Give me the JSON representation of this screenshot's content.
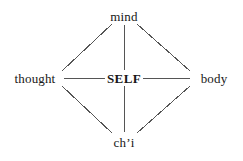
{
  "diagram": {
    "background_color": "#ffffff",
    "line_color": "#555555",
    "text_color": "#171717",
    "nodes": [
      {
        "id": "mind",
        "label": "mind",
        "x": 124,
        "y": 16,
        "emphasis": false
      },
      {
        "id": "thought",
        "label": "thought",
        "x": 35,
        "y": 78,
        "emphasis": false
      },
      {
        "id": "self",
        "label": "SELF",
        "x": 124,
        "y": 78,
        "emphasis": true
      },
      {
        "id": "body",
        "label": "body",
        "x": 214,
        "y": 78,
        "emphasis": false
      },
      {
        "id": "chi",
        "label": "ch’i",
        "x": 124,
        "y": 142,
        "emphasis": false
      }
    ],
    "edges": [
      {
        "id": "thought-mind",
        "from": "thought",
        "to": "mind",
        "x1": 62,
        "y1": 71,
        "x2": 112,
        "y2": 24
      },
      {
        "id": "mind-body",
        "from": "mind",
        "to": "body",
        "x1": 137,
        "y1": 24,
        "x2": 190,
        "y2": 71
      },
      {
        "id": "thought-chi",
        "from": "thought",
        "to": "chi",
        "x1": 62,
        "y1": 86,
        "x2": 112,
        "y2": 133
      },
      {
        "id": "chi-body",
        "from": "chi",
        "to": "body",
        "x1": 137,
        "y1": 133,
        "x2": 190,
        "y2": 86
      },
      {
        "id": "mind-self",
        "from": "mind",
        "to": "self",
        "x1": 124,
        "y1": 25,
        "x2": 124,
        "y2": 70
      },
      {
        "id": "self-chi",
        "from": "self",
        "to": "chi",
        "x1": 124,
        "y1": 86,
        "x2": 124,
        "y2": 132
      },
      {
        "id": "thought-self",
        "from": "thought",
        "to": "self",
        "x1": 64,
        "y1": 78,
        "x2": 106,
        "y2": 78
      },
      {
        "id": "self-body",
        "from": "self",
        "to": "body",
        "x1": 143,
        "y1": 78,
        "x2": 190,
        "y2": 78
      }
    ]
  }
}
